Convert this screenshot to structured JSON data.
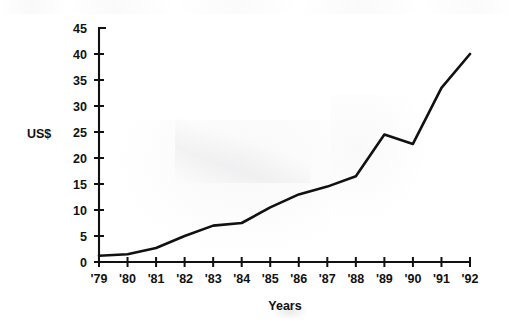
{
  "chart_data": {
    "type": "line",
    "title": "",
    "subtitle": "",
    "xlabel": "Years",
    "ylabel": "US$",
    "categories": [
      "'79",
      "'80",
      "'81",
      "'82",
      "'83",
      "'84",
      "'85",
      "'86",
      "'87",
      "'88",
      "'89",
      "'90",
      "'91",
      "'92"
    ],
    "x": [
      "'79",
      "'80",
      "'81",
      "'82",
      "'83",
      "'84",
      "'85",
      "'86",
      "'87",
      "'88",
      "'89",
      "'90",
      "'91",
      "'92"
    ],
    "values": [
      1.2,
      1.5,
      2.7,
      5.0,
      7.0,
      7.5,
      10.5,
      13.0,
      14.5,
      16.5,
      24.5,
      22.7,
      33.5,
      40.0
    ],
    "series": [
      {
        "name": "US$",
        "values": [
          1.2,
          1.5,
          2.7,
          5.0,
          7.0,
          7.5,
          10.5,
          13.0,
          14.5,
          16.5,
          24.5,
          22.7,
          33.5,
          40.0
        ]
      }
    ],
    "ylim": [
      0,
      45
    ],
    "ytick_labels": [
      "0",
      "5",
      "10",
      "15",
      "20",
      "25",
      "30",
      "35",
      "40",
      "45"
    ],
    "ytick_values": [
      0,
      5,
      10,
      15,
      20,
      25,
      30,
      35,
      40,
      45
    ],
    "xtick_labels": [
      "'79",
      "'80",
      "'81",
      "'82",
      "'83",
      "'84",
      "'85",
      "'86",
      "'87",
      "'88",
      "'89",
      "'90",
      "'91",
      "'92"
    ],
    "grid": false,
    "legend": null,
    "legend_position": "none",
    "line_color": "#111111",
    "background_color": "#ffffff",
    "annotations": []
  },
  "labels": {
    "y_axis_title": "US$",
    "x_axis_title": "Years"
  }
}
